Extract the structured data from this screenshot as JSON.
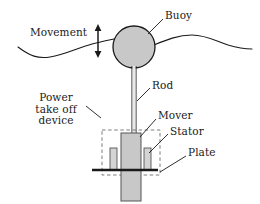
{
  "figure": {
    "type": "technical-diagram",
    "background_color": "#ffffff",
    "line_color": "#1a1a1a",
    "fill_gray": "#c8c8c8",
    "stator_fill": "#d4d4d4",
    "dash_color": "#7a7a7a"
  },
  "labels": {
    "movement": "Movement",
    "buoy": "Buoy",
    "rod": "Rod",
    "power_take_off": "Power\ntake off\ndevice",
    "mover": "Mover",
    "stator": "Stator",
    "plate": "Plate"
  },
  "parts": {
    "buoy": {
      "name": "Buoy",
      "shape": "circle",
      "cx": 134,
      "cy": 47,
      "r": 21,
      "fill": "#c8c8c8"
    },
    "rod": {
      "name": "Rod",
      "shape": "vertical-double-line",
      "x": 134,
      "y_top": 68,
      "y_bottom": 135,
      "width": 4
    },
    "mover": {
      "name": "Mover",
      "shape": "rect",
      "x": 121,
      "y": 133,
      "w": 20,
      "h": 68,
      "fill": "#c8c8c8"
    },
    "stator_left": {
      "name": "Stator",
      "shape": "rect",
      "x": 110,
      "y": 148,
      "w": 7,
      "h": 22,
      "fill": "#d4d4d4"
    },
    "stator_right": {
      "name": "Stator",
      "shape": "rect",
      "x": 144,
      "y": 148,
      "w": 7,
      "h": 22,
      "fill": "#d4d4d4"
    },
    "plate": {
      "name": "Plate",
      "shape": "thick-line",
      "x1": 92,
      "x2": 158,
      "y": 170
    },
    "sea_surface": {
      "name": "Sea surface wave",
      "shape": "wavy-line"
    },
    "movement_arrow": {
      "name": "Movement arrow",
      "shape": "double-headed-vertical-arrow",
      "x": 98,
      "y_top": 25,
      "y_bottom": 57
    },
    "pto_box": {
      "name": "Power take off device boundary",
      "shape": "dashed-rect",
      "x": 102,
      "y": 130,
      "w": 58,
      "h": 45
    }
  }
}
